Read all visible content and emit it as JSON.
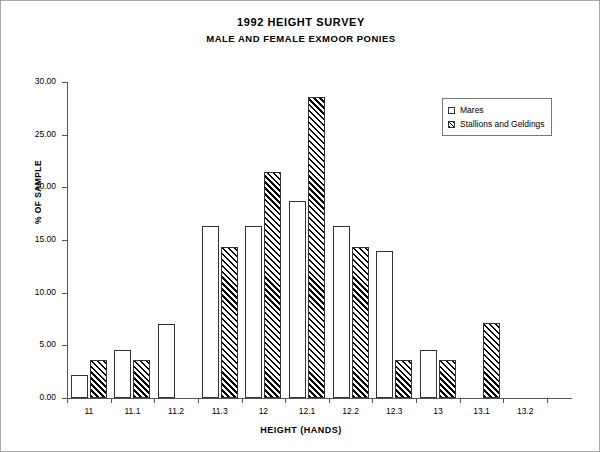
{
  "chart_data": {
    "type": "bar",
    "title": "1992 HEIGHT SURVEY",
    "subtitle": "MALE AND FEMALE EXMOOR PONIES",
    "xlabel": "HEIGHT (HANDS)",
    "ylabel": "% OF SAMPLE",
    "categories": [
      "11",
      "11.1",
      "11.2",
      "11.3",
      "12",
      "12.1",
      "12.2",
      "12.3",
      "13",
      "13.1",
      "13.2"
    ],
    "series": [
      {
        "name": "Mares",
        "fill": "open",
        "values": [
          2.2,
          4.6,
          7.0,
          16.3,
          16.3,
          18.7,
          16.3,
          14.0,
          4.6,
          0,
          0
        ]
      },
      {
        "name": "Stallions and Geldings",
        "fill": "hatched",
        "values": [
          3.6,
          3.6,
          0,
          14.3,
          21.5,
          28.6,
          14.3,
          3.6,
          3.6,
          7.1,
          0
        ]
      }
    ],
    "ylim": [
      0,
      30
    ],
    "yticks": [
      "0.00",
      "5.00",
      "10.00",
      "15.00",
      "20.00",
      "25.00",
      "30.00"
    ],
    "ytick_values": [
      0,
      5,
      10,
      15,
      20,
      25,
      30
    ],
    "grid": false,
    "legend_position": "upper-right",
    "colors": {
      "bar_outline": "#333333",
      "axis": "#555555",
      "text": "#000000",
      "background": "#ffffff",
      "frame_border": "#a9a9a9"
    }
  },
  "legend": {
    "items": [
      {
        "label": "Mares"
      },
      {
        "label": "Stallions and Geldings"
      }
    ]
  }
}
